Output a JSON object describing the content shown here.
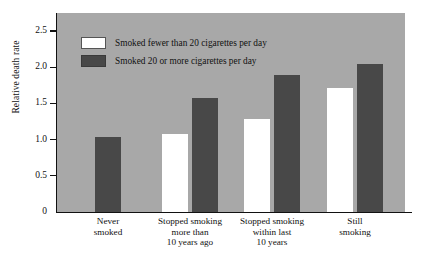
{
  "chart_data": {
    "type": "bar",
    "title": "",
    "xlabel": "",
    "ylabel": "Relative death rate",
    "ylim": [
      0,
      2.75
    ],
    "grid": false,
    "legend_position": "top-left-inside-plot",
    "yticks": [
      "0",
      "0.5",
      "1.0",
      "1.5",
      "2.0",
      "2.5"
    ],
    "ytick_values": [
      0,
      0.5,
      1.0,
      1.5,
      2.0,
      2.5
    ],
    "categories": [
      "Never\nsmoked",
      "Stopped smoking\nmore than\n10 years ago",
      "Stopped smoking\nwithin last\n10 years",
      "Still\nsmoking"
    ],
    "category_lines": [
      [
        "Never",
        "smoked"
      ],
      [
        "Stopped smoking",
        "more than",
        "10 years ago"
      ],
      [
        "Stopped smoking",
        "within last",
        "10 years"
      ],
      [
        "Still",
        "smoking"
      ]
    ],
    "series": [
      {
        "name": "Smoked fewer than 20 cigarettes per day",
        "color": "#ffffff",
        "values": [
          null,
          1.08,
          1.28,
          1.71
        ]
      },
      {
        "name": "Smoked 20 or more cigarettes per day",
        "color": "#484848",
        "values": [
          1.03,
          1.57,
          1.9,
          2.05
        ]
      }
    ]
  },
  "legend": {
    "items": [
      {
        "label": "Smoked fewer than 20 cigarettes per day",
        "swatch": "light"
      },
      {
        "label": "Smoked 20 or more cigarettes per day",
        "swatch": "dark"
      }
    ]
  },
  "axes": {
    "y_title": "Relative death rate"
  },
  "colors": {
    "plot_background": "#a8a8a8",
    "bar_light": "#ffffff",
    "bar_dark": "#484848",
    "axis": "#111111",
    "page_background": "#ffffff"
  }
}
